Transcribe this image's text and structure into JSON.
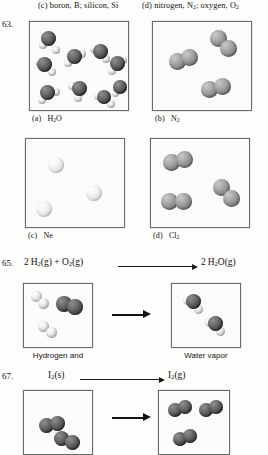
{
  "header": {
    "option_c": "(c)  boron, B; silicon, Si",
    "option_d": "(d)  nitrogen, N",
    "option_d_sub1": "2",
    "option_d_mid": "; oxygen, O",
    "option_d_sub2": "2"
  },
  "q63": {
    "number": "63.",
    "panels": [
      {
        "label": "(a)",
        "formula": "H",
        "sub": "2",
        "formula_tail": "O",
        "species": "water",
        "count": 9
      },
      {
        "label": "(b)",
        "formula": "N",
        "sub": "2",
        "formula_tail": "",
        "species": "nitrogen",
        "count": 3
      },
      {
        "label": "(c)",
        "formula": "Ne",
        "sub": "",
        "formula_tail": "",
        "species": "neon",
        "count": 3
      },
      {
        "label": "(d)",
        "formula": "Cl",
        "sub": "2",
        "formula_tail": "",
        "species": "chlorine",
        "count": 3
      }
    ]
  },
  "q65": {
    "number": "65.",
    "equation": {
      "left_coeff": "2",
      "left_1": "H",
      "left_1_sub": "2",
      "left_1_state": "(g)",
      "plus": "+",
      "left_2": "O",
      "left_2_sub": "2",
      "left_2_state": "(g)",
      "right_coeff": "2",
      "right_1": "H",
      "right_1_sub": "2",
      "right_1_tail": "O",
      "right_1_state": "(g)"
    },
    "reactant_caption": "Hydrogen and",
    "product_caption": "Water vapor",
    "reactant_molecules": {
      "hydrogen": 2,
      "oxygen": 1
    },
    "product_molecules": {
      "water": 2
    }
  },
  "q67": {
    "number": "67.",
    "equation": {
      "left": "I",
      "left_sub": "2",
      "left_state": "(s)",
      "right": "I",
      "right_sub": "2",
      "right_state": "(g)"
    },
    "reactant_molecules": {
      "iodine_solid": 3
    },
    "product_molecules": {
      "iodine_gas": 3
    }
  },
  "colors": {
    "ink": "#111111",
    "box_border": "#6a6a6a",
    "page_bg": "#fdfdfb",
    "panel_bg": "#fbfbfa"
  }
}
